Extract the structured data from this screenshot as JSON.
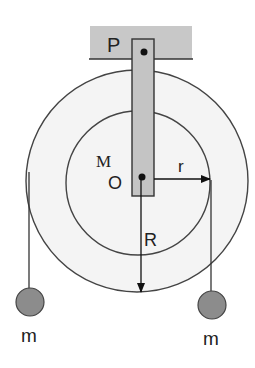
{
  "figure": {
    "labels": {
      "pivot_top": "P",
      "disc_mass": "M",
      "center": "O",
      "inner_radius": "r",
      "outer_radius": "R",
      "left_mass": "m",
      "right_mass": "m"
    },
    "colors": {
      "ceiling_fill": "#c8c8c8",
      "rod_fill": "#c4c4c4",
      "mass_fill": "#8c8c8c",
      "disc_fill": "#f4f4f4",
      "stroke": "#333333"
    }
  }
}
